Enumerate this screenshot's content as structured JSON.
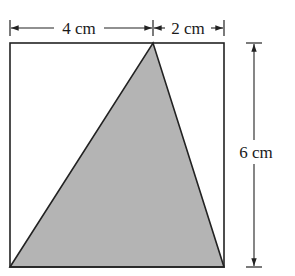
{
  "diagram": {
    "type": "geometry",
    "shape": "rectangle with inscribed shaded triangle",
    "labels": {
      "top_left": "4 cm",
      "top_right": "2 cm",
      "right": "6 cm"
    },
    "dimensions": {
      "width_left_segment": 4,
      "width_right_segment": 2,
      "height": 6,
      "unit": "cm"
    },
    "colors": {
      "stroke": "#222222",
      "triangle_fill": "#b4b4b4",
      "background": "#ffffff"
    }
  }
}
